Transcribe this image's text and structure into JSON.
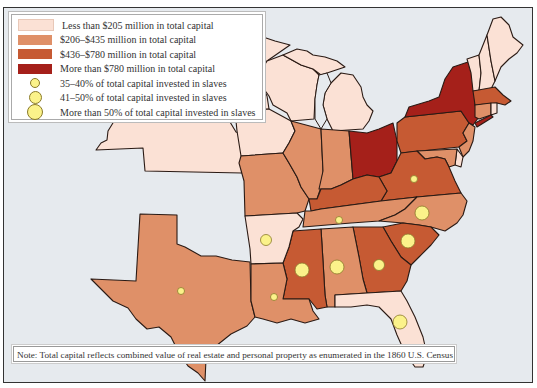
{
  "colors": {
    "tier1": "#fbe1d5",
    "tier2": "#df9068",
    "tier3": "#c65a33",
    "tier4": "#a5201a",
    "water": "#e6eaee",
    "dot": "#fbf28a"
  },
  "legend": {
    "items": [
      {
        "kind": "swatch",
        "color": "#fbe1d5",
        "label": "Less than $205 million in total capital"
      },
      {
        "kind": "swatch",
        "color": "#df9068",
        "label": "$206–$435 million in total capital"
      },
      {
        "kind": "swatch",
        "color": "#c65a33",
        "label": "$436–$780 million in total capital"
      },
      {
        "kind": "swatch",
        "color": "#a5201a",
        "label": "More than $780 million in total capital"
      },
      {
        "kind": "circle",
        "size": "small",
        "label": "35–40% of total capital invested in slaves"
      },
      {
        "kind": "circle",
        "size": "medium",
        "label": "41–50% of total capital invested in slaves"
      },
      {
        "kind": "circle",
        "size": "large",
        "label": "More than 50% of total capital invested in slaves"
      }
    ]
  },
  "note": "Note: Total capital reflects combined value of real estate and personal property as enumerated in the 1860 U.S. Census",
  "states": [
    {
      "name": "Minnesota",
      "tier": 1
    },
    {
      "name": "Wisconsin",
      "tier": 1
    },
    {
      "name": "Michigan",
      "tier": 1
    },
    {
      "name": "Iowa",
      "tier": 1
    },
    {
      "name": "Kansas",
      "tier": 1
    },
    {
      "name": "Missouri",
      "tier": 2
    },
    {
      "name": "Illinois",
      "tier": 2
    },
    {
      "name": "Indiana",
      "tier": 2
    },
    {
      "name": "Ohio",
      "tier": 4
    },
    {
      "name": "Pennsylvania",
      "tier": 3
    },
    {
      "name": "New York",
      "tier": 4
    },
    {
      "name": "Maine",
      "tier": 1
    },
    {
      "name": "New Hampshire",
      "tier": 1
    },
    {
      "name": "Vermont",
      "tier": 1
    },
    {
      "name": "Massachusetts",
      "tier": 3
    },
    {
      "name": "Connecticut",
      "tier": 2
    },
    {
      "name": "Rhode Island",
      "tier": 1
    },
    {
      "name": "New Jersey",
      "tier": 2
    },
    {
      "name": "Delaware",
      "tier": 1
    },
    {
      "name": "Maryland",
      "tier": 2
    },
    {
      "name": "Kentucky",
      "tier": 3,
      "slave_share": null
    },
    {
      "name": "Virginia",
      "tier": 3,
      "slave_share": "small"
    },
    {
      "name": "North Carolina",
      "tier": 2,
      "slave_share": "medium"
    },
    {
      "name": "Tennessee",
      "tier": 2,
      "slave_share": "small"
    },
    {
      "name": "Arkansas",
      "tier": 1,
      "slave_share": "medium"
    },
    {
      "name": "South Carolina",
      "tier": 3,
      "slave_share": "large"
    },
    {
      "name": "Georgia",
      "tier": 3,
      "slave_share": "medium"
    },
    {
      "name": "Alabama",
      "tier": 2,
      "slave_share": "large"
    },
    {
      "name": "Mississippi",
      "tier": 3,
      "slave_share": "large"
    },
    {
      "name": "Louisiana",
      "tier": 2,
      "slave_share": "small"
    },
    {
      "name": "Texas",
      "tier": 2,
      "slave_share": "small"
    },
    {
      "name": "Florida",
      "tier": 1,
      "slave_share": "large"
    }
  ]
}
